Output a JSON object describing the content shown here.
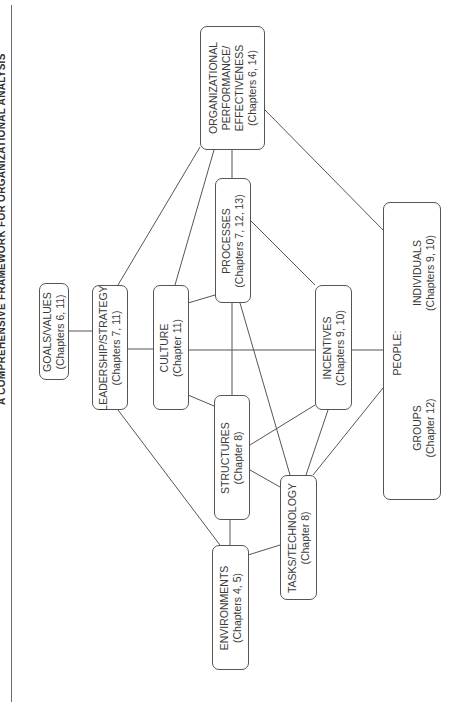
{
  "figure": {
    "title": "A COMPREHENSIVE FRAMEWORK FOR ORGANIZATIONAL ANALYSIS",
    "orientation": "rotated -90deg (landscape on portrait page)"
  },
  "nodes": {
    "goals": {
      "label": "GOALS/VALUES",
      "chapters": "(Chapters 6, 11)"
    },
    "leadership": {
      "label": "LEADERSHIP/STRATEGY",
      "chapters": "(Chapters 7, 11)"
    },
    "culture": {
      "label": "CULTURE",
      "chapters": "(Chapter 11)"
    },
    "processes": {
      "label": "PROCESSES",
      "chapters": "(Chapters 7, 12, 13)"
    },
    "performance": {
      "line1": "ORGANIZATIONAL",
      "line2": "PERFORMANCE/",
      "line3": "EFFECTIVENESS",
      "chapters": "(Chapters 6, 14)"
    },
    "structures": {
      "label": "STRUCTURES",
      "chapters": "(Chapter 8)"
    },
    "incentives": {
      "label": "INCENTIVES",
      "chapters": "(Chapters 9, 10)"
    },
    "people": {
      "label": "PEOPLE:",
      "groups": {
        "label": "GROUPS",
        "chapters": "(Chapter 12)"
      },
      "individuals": {
        "label": "INDIVIDUALS",
        "chapters": "(Chapters 9, 10)"
      }
    },
    "environments": {
      "label": "ENVIRONMENTS",
      "chapters": "(Chapters 4, 5)"
    },
    "tasks": {
      "label": "TASKS/TECHNOLOGY",
      "chapters": "(Chapter 8)"
    }
  },
  "edges": [
    [
      "goals",
      "leadership"
    ],
    [
      "leadership",
      "culture"
    ],
    [
      "leadership",
      "performance"
    ],
    [
      "leadership",
      "environments"
    ],
    [
      "culture",
      "performance"
    ],
    [
      "culture",
      "processes"
    ],
    [
      "culture",
      "structures"
    ],
    [
      "culture",
      "incentives"
    ],
    [
      "processes",
      "performance"
    ],
    [
      "processes",
      "structures"
    ],
    [
      "processes",
      "tasks"
    ],
    [
      "processes",
      "incentives"
    ],
    [
      "performance",
      "people"
    ],
    [
      "incentives",
      "people"
    ],
    [
      "incentives",
      "structures"
    ],
    [
      "incentives",
      "tasks"
    ],
    [
      "structures",
      "environments"
    ],
    [
      "structures",
      "tasks"
    ],
    [
      "environments",
      "tasks"
    ],
    [
      "tasks",
      "people"
    ]
  ],
  "colors": {
    "line": "#555555",
    "text": "#3a3a3a",
    "background": "#ffffff"
  }
}
